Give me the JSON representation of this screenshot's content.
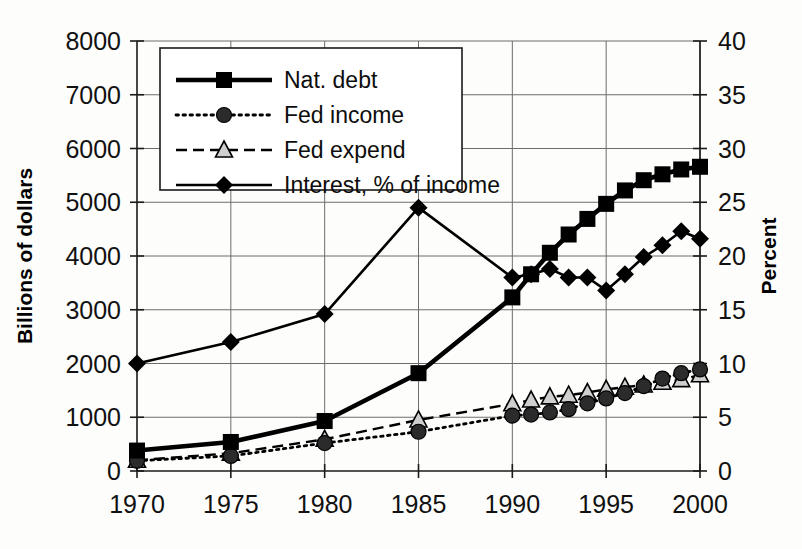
{
  "chart_data": {
    "type": "line",
    "title": "",
    "xlabel": "",
    "ylabel": "Billions of dollars",
    "y2label": "Percent",
    "x": [
      1970,
      1975,
      1980,
      1985,
      1990,
      1991,
      1992,
      1993,
      1994,
      1995,
      1996,
      1997,
      1998,
      1999,
      2000
    ],
    "xticks": [
      "1970",
      "1975",
      "1980",
      "1985",
      "1990",
      "1995",
      "2000"
    ],
    "xtick_values": [
      1970,
      1975,
      1980,
      1985,
      1990,
      1995,
      2000
    ],
    "xlim": [
      1970,
      2000
    ],
    "ylim": [
      0,
      8000
    ],
    "yticks": [
      "0",
      "1000",
      "2000",
      "3000",
      "4000",
      "5000",
      "6000",
      "7000",
      "8000"
    ],
    "ytick_values": [
      0,
      1000,
      2000,
      3000,
      4000,
      5000,
      6000,
      7000,
      8000
    ],
    "y2lim": [
      0,
      40
    ],
    "y2ticks": [
      "0",
      "5",
      "10",
      "15",
      "20",
      "25",
      "30",
      "35",
      "40"
    ],
    "y2tick_values": [
      0,
      5,
      10,
      15,
      20,
      25,
      30,
      35,
      40
    ],
    "grid": true,
    "legend_position": "top-left-inside",
    "series": [
      {
        "name": "Nat. debt",
        "axis": "left",
        "unit": "Billions of dollars",
        "marker": "square",
        "line": "solid-thick",
        "x": [
          1970,
          1975,
          1980,
          1985,
          1990,
          1991,
          1992,
          1993,
          1994,
          1995,
          1996,
          1997,
          1998,
          1999,
          2000
        ],
        "values": [
          380,
          540,
          930,
          1820,
          3230,
          3660,
          4060,
          4400,
          4690,
          4970,
          5220,
          5410,
          5520,
          5610,
          5660
        ]
      },
      {
        "name": "Fed income",
        "axis": "left",
        "unit": "Billions of dollars",
        "marker": "circle",
        "line": "dotted",
        "x": [
          1970,
          1975,
          1980,
          1985,
          1990,
          1991,
          1992,
          1993,
          1994,
          1995,
          1996,
          1997,
          1998,
          1999,
          2000
        ],
        "values": [
          190,
          280,
          520,
          730,
          1030,
          1050,
          1090,
          1150,
          1260,
          1350,
          1450,
          1580,
          1720,
          1820,
          1890
        ]
      },
      {
        "name": "Fed expend",
        "axis": "left",
        "unit": "Billions of dollars",
        "marker": "triangle",
        "line": "dashed",
        "x": [
          1970,
          1975,
          1980,
          1985,
          1990,
          1991,
          1992,
          1993,
          1994,
          1995,
          1996,
          1997,
          1998,
          1999,
          2000
        ],
        "values": [
          200,
          330,
          590,
          950,
          1250,
          1320,
          1380,
          1410,
          1460,
          1520,
          1560,
          1600,
          1650,
          1700,
          1790
        ]
      },
      {
        "name": "Interest, % of income",
        "axis": "right",
        "unit": "Percent",
        "marker": "diamond",
        "line": "solid",
        "x": [
          1970,
          1975,
          1980,
          1985,
          1990,
          1991,
          1992,
          1993,
          1994,
          1995,
          1996,
          1997,
          1998,
          1999,
          2000
        ],
        "values": [
          10.0,
          12.0,
          14.6,
          24.5,
          18.0,
          18.3,
          18.8,
          18.0,
          18.0,
          16.8,
          18.3,
          19.9,
          21.0,
          22.3,
          21.6
        ],
        "values_in_left_units": [
          2000,
          2400,
          2920,
          4900,
          3600,
          3670,
          3760,
          3600,
          3600,
          3350,
          3660,
          3980,
          4200,
          4450,
          4310
        ]
      }
    ],
    "legend": [
      {
        "label": "Nat. debt",
        "marker": "square",
        "line": "solid-thick"
      },
      {
        "label": "Fed income",
        "marker": "circle",
        "line": "dotted"
      },
      {
        "label": "Fed expend",
        "marker": "triangle",
        "line": "dashed"
      },
      {
        "label": "Interest, % of income",
        "marker": "diamond",
        "line": "solid"
      }
    ],
    "colors": {
      "ink": "#000000",
      "grid": "#6d6d6d",
      "background": "#fdfdfb"
    }
  }
}
